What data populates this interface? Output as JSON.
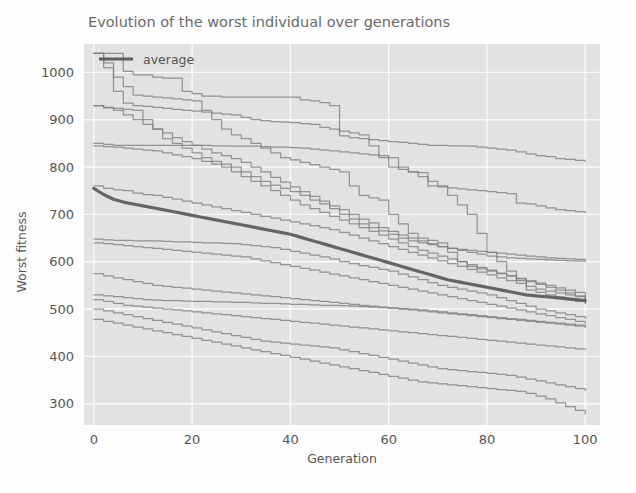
{
  "figure": {
    "background_color": "#fdfdfd",
    "plot_background_color": "#e2e2e2",
    "grid_color": "#fafafa",
    "line_color": "#7c7c7c",
    "average_line_color": "#5e5e5e"
  },
  "chart_data": {
    "type": "line",
    "title": "Evolution of the worst individual over generations",
    "xlabel": "Generation",
    "ylabel": "Worst fitness",
    "xlim": [
      -2,
      103
    ],
    "ylim": [
      255,
      1060
    ],
    "xticks": [
      0,
      20,
      40,
      60,
      80,
      100
    ],
    "yticks": [
      300,
      400,
      500,
      600,
      700,
      800,
      900,
      1000
    ],
    "xtick_labels": [
      "0",
      "20",
      "40",
      "60",
      "80",
      "100"
    ],
    "ytick_labels": [
      "300",
      "400",
      "500",
      "600",
      "700",
      "800",
      "900",
      "1000"
    ],
    "grid": true,
    "legend": {
      "position": "upper-left",
      "entries": [
        {
          "label": "average",
          "color": "#5e5e5e",
          "linewidth": 3
        }
      ]
    },
    "x": [
      0,
      2,
      4,
      6,
      8,
      10,
      12,
      14,
      16,
      18,
      20,
      22,
      24,
      26,
      28,
      30,
      32,
      34,
      36,
      38,
      40,
      42,
      44,
      46,
      48,
      50,
      52,
      54,
      56,
      58,
      60,
      62,
      64,
      66,
      68,
      70,
      72,
      74,
      76,
      78,
      80,
      82,
      84,
      86,
      88,
      90,
      92,
      94,
      96,
      98,
      100
    ],
    "series": [
      {
        "name": "run-1",
        "kind": "individual",
        "values": [
          1040,
          1040,
          1040,
          1002,
          995,
          995,
          990,
          988,
          988,
          960,
          955,
          950,
          950,
          948,
          948,
          948,
          948,
          948,
          948,
          948,
          948,
          942,
          940,
          936,
          930,
          866,
          862,
          860,
          858,
          856,
          854,
          852,
          850,
          848,
          846,
          846,
          845,
          845,
          844,
          842,
          840,
          838,
          836,
          832,
          828,
          824,
          822,
          818,
          816,
          814,
          812
        ]
      },
      {
        "name": "run-2",
        "kind": "individual",
        "values": [
          1040,
          1010,
          960,
          935,
          930,
          928,
          926,
          924,
          922,
          920,
          918,
          916,
          914,
          912,
          910,
          905,
          900,
          898,
          896,
          895,
          894,
          892,
          890,
          884,
          880,
          876,
          872,
          868,
          845,
          820,
          800,
          795,
          790,
          788,
          760,
          758,
          756,
          754,
          752,
          750,
          748,
          746,
          744,
          724,
          722,
          718,
          714,
          710,
          708,
          706,
          704
        ]
      },
      {
        "name": "run-3",
        "kind": "individual",
        "values": [
          1040,
          1020,
          990,
          970,
          952,
          950,
          948,
          946,
          944,
          942,
          940,
          920,
          900,
          880,
          868,
          860,
          850,
          840,
          830,
          820,
          815,
          810,
          805,
          800,
          795,
          790,
          760,
          740,
          735,
          730,
          700,
          680,
          660,
          650,
          645,
          640,
          620,
          600,
          590,
          585,
          580,
          575,
          570,
          565,
          560,
          555,
          550,
          545,
          540,
          535,
          512
        ]
      },
      {
        "name": "run-4",
        "kind": "individual",
        "values": [
          930,
          926,
          924,
          922,
          920,
          900,
          880,
          860,
          850,
          840,
          830,
          820,
          812,
          806,
          800,
          790,
          780,
          770,
          762,
          755,
          748,
          740,
          730,
          722,
          712,
          700,
          690,
          680,
          672,
          665,
          658,
          650,
          644,
          640,
          636,
          632,
          628,
          626,
          624,
          622,
          620,
          618,
          616,
          614,
          612,
          610,
          608,
          607,
          606,
          605,
          604
        ]
      },
      {
        "name": "run-5",
        "kind": "individual",
        "values": [
          930,
          925,
          920,
          910,
          900,
          890,
          880,
          872,
          862,
          854,
          846,
          838,
          830,
          824,
          818,
          810,
          800,
          790,
          778,
          768,
          758,
          748,
          738,
          728,
          718,
          710,
          700,
          690,
          682,
          672,
          664,
          656,
          650,
          644,
          638,
          632,
          628,
          624,
          620,
          616,
          612,
          610,
          608,
          607,
          606,
          605,
          604,
          603,
          602,
          601,
          600
        ]
      },
      {
        "name": "run-6",
        "kind": "individual",
        "values": [
          850,
          848,
          846,
          846,
          846,
          846,
          846,
          846,
          846,
          846,
          846,
          846,
          845,
          845,
          844,
          844,
          844,
          843,
          842,
          842,
          841,
          840,
          838,
          836,
          834,
          832,
          830,
          828,
          826,
          824,
          820,
          800,
          790,
          780,
          770,
          760,
          740,
          720,
          700,
          660,
          620,
          600,
          580,
          560,
          540,
          535,
          530,
          525,
          520,
          516,
          512
        ]
      },
      {
        "name": "run-7",
        "kind": "individual",
        "values": [
          845,
          843,
          842,
          840,
          838,
          836,
          834,
          830,
          826,
          822,
          818,
          812,
          806,
          800,
          790,
          780,
          770,
          760,
          750,
          740,
          730,
          720,
          712,
          704,
          696,
          688,
          680,
          672,
          664,
          656,
          648,
          640,
          632,
          624,
          618,
          612,
          606,
          600,
          594,
          588,
          582,
          576,
          570,
          564,
          558,
          552,
          546,
          540,
          534,
          528,
          522
        ]
      },
      {
        "name": "run-8",
        "kind": "individual",
        "values": [
          760,
          755,
          752,
          750,
          745,
          742,
          740,
          736,
          732,
          728,
          724,
          720,
          716,
          712,
          708,
          704,
          700,
          696,
          692,
          688,
          684,
          680,
          676,
          672,
          668,
          662,
          656,
          650,
          644,
          638,
          632,
          626,
          620,
          614,
          608,
          602,
          596,
          590,
          584,
          578,
          572,
          566,
          560,
          554,
          548,
          542,
          538,
          534,
          530,
          526,
          520
        ]
      },
      {
        "name": "run-9",
        "kind": "individual",
        "values": [
          648,
          646,
          645,
          645,
          644,
          644,
          644,
          643,
          642,
          642,
          641,
          640,
          640,
          639,
          638,
          636,
          634,
          632,
          630,
          626,
          622,
          618,
          614,
          610,
          606,
          600,
          596,
          592,
          588,
          584,
          580,
          574,
          568,
          562,
          556,
          550,
          546,
          542,
          538,
          534,
          530,
          524,
          518,
          512,
          506,
          500,
          496,
          492,
          488,
          484,
          480
        ]
      },
      {
        "name": "run-10",
        "kind": "individual",
        "values": [
          640,
          638,
          636,
          634,
          632,
          630,
          628,
          626,
          624,
          622,
          620,
          618,
          616,
          614,
          612,
          610,
          606,
          602,
          598,
          594,
          590,
          586,
          582,
          578,
          574,
          570,
          566,
          562,
          558,
          554,
          550,
          546,
          542,
          538,
          534,
          530,
          526,
          522,
          518,
          514,
          510,
          506,
          502,
          498,
          494,
          490,
          486,
          482,
          478,
          474,
          470
        ]
      },
      {
        "name": "run-11",
        "kind": "individual",
        "values": [
          575,
          570,
          566,
          562,
          558,
          554,
          550,
          548,
          546,
          544,
          542,
          540,
          538,
          536,
          534,
          532,
          530,
          528,
          526,
          524,
          522,
          520,
          518,
          516,
          514,
          512,
          510,
          508,
          506,
          504,
          502,
          500,
          498,
          496,
          494,
          492,
          490,
          488,
          486,
          484,
          482,
          480,
          478,
          476,
          474,
          472,
          470,
          468,
          466,
          464,
          462
        ]
      },
      {
        "name": "run-12",
        "kind": "individual",
        "values": [
          530,
          528,
          526,
          524,
          522,
          520,
          519,
          518,
          518,
          517,
          516,
          516,
          515,
          515,
          514,
          514,
          513,
          512,
          512,
          511,
          510,
          510,
          509,
          508,
          508,
          507,
          506,
          505,
          504,
          503,
          502,
          501,
          500,
          498,
          496,
          494,
          492,
          490,
          488,
          486,
          484,
          482,
          480,
          478,
          476,
          474,
          472,
          470,
          468,
          466,
          462
        ]
      },
      {
        "name": "run-13",
        "kind": "individual",
        "values": [
          520,
          516,
          512,
          508,
          506,
          504,
          502,
          500,
          498,
          496,
          494,
          492,
          490,
          488,
          486,
          484,
          482,
          480,
          478,
          476,
          474,
          472,
          470,
          468,
          466,
          464,
          462,
          460,
          458,
          456,
          454,
          452,
          450,
          448,
          446,
          444,
          442,
          440,
          438,
          436,
          434,
          432,
          430,
          428,
          426,
          424,
          422,
          420,
          418,
          416,
          414
        ]
      },
      {
        "name": "run-14",
        "kind": "individual",
        "values": [
          500,
          496,
          492,
          488,
          484,
          480,
          476,
          472,
          468,
          464,
          460,
          456,
          452,
          448,
          444,
          440,
          436,
          432,
          430,
          428,
          426,
          424,
          422,
          420,
          418,
          414,
          410,
          406,
          402,
          398,
          394,
          390,
          386,
          382,
          378,
          374,
          372,
          370,
          368,
          366,
          364,
          362,
          360,
          356,
          352,
          348,
          344,
          340,
          336,
          332,
          328
        ]
      },
      {
        "name": "run-15",
        "kind": "individual",
        "values": [
          478,
          474,
          470,
          466,
          462,
          458,
          454,
          450,
          446,
          442,
          438,
          434,
          430,
          426,
          422,
          418,
          414,
          410,
          406,
          402,
          398,
          394,
          390,
          386,
          382,
          378,
          374,
          370,
          366,
          362,
          358,
          354,
          350,
          346,
          344,
          342,
          340,
          338,
          336,
          334,
          332,
          330,
          328,
          326,
          322,
          316,
          310,
          302,
          294,
          286,
          278
        ]
      },
      {
        "name": "average",
        "kind": "average",
        "values": [
          755,
          742,
          732,
          726,
          722,
          718,
          714,
          710,
          706,
          702,
          698,
          694,
          690,
          686,
          682,
          678,
          674,
          670,
          666,
          662,
          658,
          652,
          646,
          640,
          634,
          628,
          622,
          616,
          610,
          604,
          598,
          592,
          586,
          580,
          574,
          568,
          562,
          558,
          554,
          550,
          546,
          542,
          538,
          534,
          530,
          528,
          526,
          524,
          522,
          520,
          518
        ]
      }
    ]
  }
}
